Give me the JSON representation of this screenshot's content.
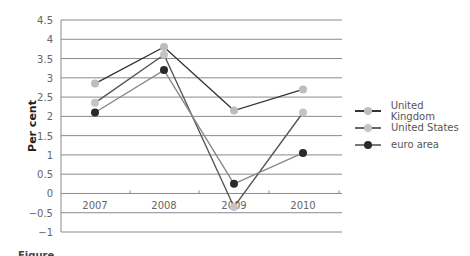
{
  "chart_data": {
    "type": "line",
    "title": "",
    "xlabel": "",
    "ylabel": "Per cent",
    "categories": [
      "2007",
      "2008",
      "2009",
      "2010"
    ],
    "ylim": [
      -1,
      4.5
    ],
    "yticks": [
      "4.5",
      "4",
      "3.5",
      "3",
      "2.5",
      "2",
      "1.5",
      "1",
      "0.5",
      "0",
      "−0.5",
      "−1"
    ],
    "grid": true,
    "legend_position": "right",
    "series": [
      {
        "name": "United Kingdom",
        "values": [
          2.85,
          3.8,
          2.15,
          2.7
        ],
        "line_color": "#333333",
        "marker_color": "#bdbdbd"
      },
      {
        "name": "United States",
        "values": [
          2.35,
          3.6,
          -0.35,
          2.1
        ],
        "line_color": "#555555",
        "marker_color": "#c4c4c4"
      },
      {
        "name": "euro area",
        "values": [
          2.1,
          3.2,
          0.25,
          1.05
        ],
        "line_color": "#888888",
        "marker_color": "#2a2a2a"
      }
    ]
  },
  "legend": {
    "items": [
      {
        "label": "United Kingdom",
        "line": "#333333",
        "marker": "#bdbdbd"
      },
      {
        "label": "United States",
        "line": "#666666",
        "marker": "#c4c4c4"
      },
      {
        "label": "euro area",
        "line": "#777777",
        "marker": "#2a2a2a"
      }
    ]
  },
  "caption": {
    "text": "Figure"
  }
}
